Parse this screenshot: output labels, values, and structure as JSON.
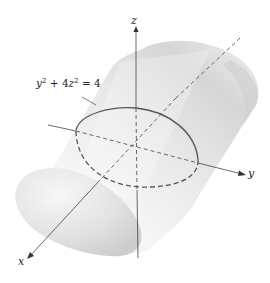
{
  "figure": {
    "surface": "elliptic-cylinder",
    "axes": {
      "x_label": "x",
      "y_label": "y",
      "z_label": "z"
    },
    "equation": {
      "base": "y",
      "exp1": "2",
      "middle": " + 4",
      "var2": "z",
      "exp2": "2",
      "rhs": " = 4"
    },
    "colors": {
      "surface_light": "#f4f4f4",
      "surface_dark": "#c9c9c9",
      "curve": "#555555",
      "axis": "#444444"
    }
  }
}
